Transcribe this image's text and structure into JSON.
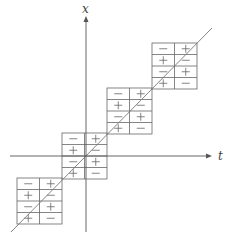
{
  "diagram": {
    "axes": {
      "vertical": {
        "label": "x",
        "x": 86,
        "y_top": 16,
        "y_bottom": 232
      },
      "horizontal": {
        "label": "t",
        "y": 156,
        "x_left": 10,
        "x_right": 212
      }
    },
    "diagonal": {
      "x1": 11,
      "y1": 232,
      "x2": 212,
      "y2": 28
    },
    "cell_w": 22.5,
    "cell_h": 11.5,
    "boxes": [
      {
        "x": 152,
        "y": 43,
        "signs": [
          [
            "-",
            "+"
          ],
          [
            "+",
            "-"
          ],
          [
            "-",
            "+"
          ],
          [
            "+",
            "-"
          ]
        ]
      },
      {
        "x": 107,
        "y": 88,
        "signs": [
          [
            "-",
            "+"
          ],
          [
            "+",
            "-"
          ],
          [
            "-",
            "+"
          ],
          [
            "+",
            "-"
          ]
        ]
      },
      {
        "x": 62,
        "y": 133,
        "signs": [
          [
            "-",
            "+"
          ],
          [
            "+",
            "-"
          ],
          [
            "-",
            "+"
          ],
          [
            "+",
            "-"
          ]
        ]
      },
      {
        "x": 17,
        "y": 178,
        "signs": [
          [
            "-",
            "+"
          ],
          [
            "+",
            "-"
          ],
          [
            "-",
            "+"
          ],
          [
            "+",
            "-"
          ]
        ]
      }
    ]
  }
}
